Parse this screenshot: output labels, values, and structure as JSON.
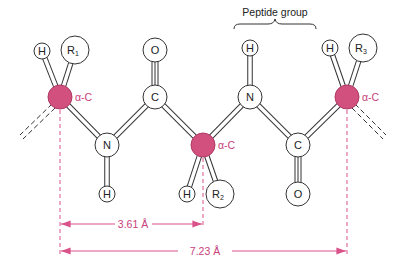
{
  "title": "Peptide group",
  "colors": {
    "alpha_carbon_fill": "#d2507e",
    "alpha_label": "#c8407a",
    "dimension_line": "#d9538a",
    "atom_stroke": "#333333",
    "atom_fill": "#ffffff"
  },
  "atoms": {
    "alpha_c_1": {
      "label": "",
      "tag": "α-C"
    },
    "h_1": {
      "label": "H"
    },
    "r_1": {
      "label": "R",
      "sub": "1"
    },
    "c_1": {
      "label": "C"
    },
    "o_1": {
      "label": "O"
    },
    "n_1": {
      "label": "N"
    },
    "h_n1": {
      "label": "H"
    },
    "alpha_c_2": {
      "label": "",
      "tag": "α-C"
    },
    "h_2": {
      "label": "H"
    },
    "r_2": {
      "label": "R",
      "sub": "2"
    },
    "n_2": {
      "label": "N"
    },
    "h_n2": {
      "label": "H"
    },
    "c_2": {
      "label": "C"
    },
    "o_2": {
      "label": "O"
    },
    "alpha_c_3": {
      "label": "",
      "tag": "α-C"
    },
    "h_3": {
      "label": "H"
    },
    "r_3": {
      "label": "R",
      "sub": "3"
    }
  },
  "dimensions": {
    "short": "3.61 Å",
    "long": "7.23 Å"
  }
}
